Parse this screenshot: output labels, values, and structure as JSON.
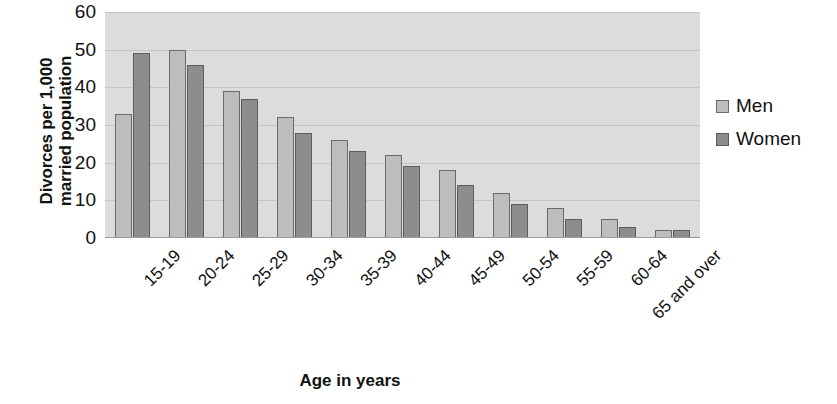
{
  "chart_data": {
    "type": "bar",
    "title": "",
    "xlabel": "Age in years",
    "ylabel": "Divorces per 1,000\nmarried population",
    "categories": [
      "15-19",
      "20-24",
      "25-29",
      "30-34",
      "35-39",
      "40-44",
      "45-49",
      "50-54",
      "55-59",
      "60-64",
      "65 and over"
    ],
    "series": [
      {
        "name": "Men",
        "color": "#bdbdbd",
        "values": [
          33,
          50,
          39,
          32,
          26,
          22,
          18,
          12,
          8,
          5,
          2
        ]
      },
      {
        "name": "Women",
        "color": "#8d8d8d",
        "values": [
          49,
          46,
          37,
          28,
          23,
          19,
          14,
          9,
          5,
          3,
          2
        ]
      }
    ],
    "ylim": [
      0,
      60
    ],
    "yticks": [
      0,
      10,
      20,
      30,
      40,
      50,
      60
    ],
    "ytick_labels": [
      "0",
      "10",
      "20",
      "30",
      "40",
      "50",
      "60"
    ],
    "grid": true,
    "grid_axis": "y",
    "legend_position": "right",
    "plot_background": "#dcdcdc",
    "xtick_rotation": "-45"
  },
  "legend": {
    "items": [
      {
        "label": "Men",
        "swatch": "men"
      },
      {
        "label": "Women",
        "swatch": "women"
      }
    ]
  },
  "axis_titles": {
    "y": "Divorces per 1,000\nmarried population",
    "x": "Age in years"
  }
}
